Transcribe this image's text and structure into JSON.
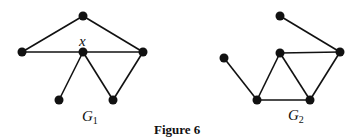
{
  "caption": "Figure 6",
  "graphs": [
    {
      "name": "G1",
      "label": "G",
      "label_sub": "1",
      "label_pos": [
        82,
        108
      ],
      "vertex_label": {
        "text": "x",
        "pos": [
          79,
          33
        ]
      },
      "nodes": [
        [
          83,
          16
        ],
        [
          22,
          52
        ],
        [
          83,
          52
        ],
        [
          143,
          52
        ],
        [
          59,
          100
        ],
        [
          113,
          100
        ]
      ],
      "edges": [
        [
          0,
          1
        ],
        [
          0,
          3
        ],
        [
          1,
          2
        ],
        [
          2,
          3
        ],
        [
          2,
          4
        ],
        [
          2,
          5
        ],
        [
          5,
          3
        ]
      ]
    },
    {
      "name": "G2",
      "label": "G",
      "label_sub": "2",
      "label_pos": [
        288,
        107
      ],
      "nodes": [
        [
          280,
          16
        ],
        [
          224,
          58
        ],
        [
          280,
          53
        ],
        [
          340,
          52
        ],
        [
          257,
          100
        ],
        [
          310,
          100
        ]
      ],
      "edges": [
        [
          0,
          3
        ],
        [
          1,
          4
        ],
        [
          4,
          2
        ],
        [
          2,
          3
        ],
        [
          2,
          5
        ],
        [
          4,
          5
        ],
        [
          5,
          3
        ]
      ]
    }
  ]
}
